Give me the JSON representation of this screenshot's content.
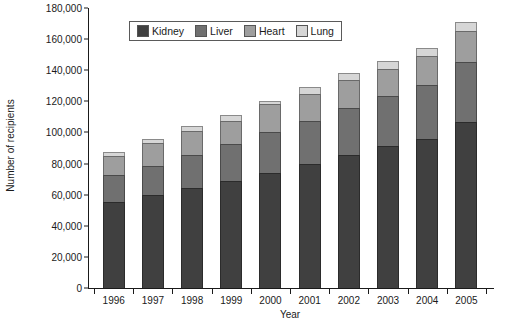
{
  "chart_data": {
    "type": "bar",
    "subtype": "stacked-vertical",
    "title": "",
    "xlabel": "Year",
    "ylabel": "Number of recipients",
    "categories": [
      "1996",
      "1997",
      "1998",
      "1999",
      "2000",
      "2001",
      "2002",
      "2003",
      "2004",
      "2005"
    ],
    "series": [
      {
        "name": "Kidney",
        "color": "#404040",
        "values": [
          55000,
          60000,
          64500,
          69000,
          74000,
          80000,
          85500,
          91000,
          96000,
          106500
        ]
      },
      {
        "name": "Liver",
        "color": "#707070",
        "values": [
          17500,
          18500,
          21000,
          23500,
          26500,
          27500,
          30000,
          32500,
          34500,
          39000
        ]
      },
      {
        "name": "Heart",
        "color": "#9e9e9e",
        "values": [
          12500,
          14500,
          15500,
          15000,
          17500,
          17500,
          18000,
          17000,
          18500,
          19500
        ]
      },
      {
        "name": "Lung",
        "color": "#d6d6d6",
        "values": [
          2500,
          3000,
          3000,
          4000,
          2500,
          4000,
          4500,
          5500,
          5500,
          6000
        ]
      }
    ],
    "totals": [
      87500,
      96000,
      104000,
      111500,
      120500,
      129000,
      138000,
      146000,
      154500,
      171000
    ],
    "ylim": [
      0,
      180000
    ],
    "ytick_values": [
      0,
      20000,
      40000,
      60000,
      80000,
      100000,
      120000,
      140000,
      160000,
      180000
    ],
    "ytick_labels": [
      "0",
      "20,000",
      "40,000",
      "60,000",
      "80,000",
      "100,000",
      "120,000",
      "140,000",
      "160,000",
      "180,000"
    ],
    "grid": false,
    "legend_position": "top-center",
    "legend_entries": [
      "Kidney",
      "Liver",
      "Heart",
      "Lung"
    ]
  },
  "legend": {
    "items": [
      {
        "label": "Kidney",
        "key": "kidney"
      },
      {
        "label": "Liver",
        "key": "liver"
      },
      {
        "label": "Heart",
        "key": "heart"
      },
      {
        "label": "Lung",
        "key": "lung"
      }
    ]
  },
  "axes": {
    "y_title": "Number of recipients",
    "x_title": "Year"
  },
  "bottom_caption": ""
}
